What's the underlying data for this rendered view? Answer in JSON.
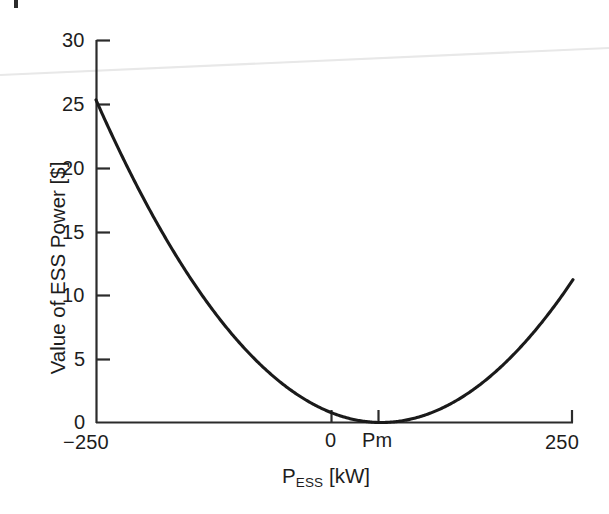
{
  "figure": {
    "background_color": "#ffffff",
    "line_color": "#1a1a1a",
    "axis_color": "#2b2b2b",
    "artifact": {
      "name": "scan-line-artifact",
      "color": "#e6e6e6",
      "description": "faint diagonal scan line"
    }
  },
  "chart_data": {
    "type": "line",
    "title": "",
    "xlabel": "P_ESS [kW]",
    "xlabel_base": "P",
    "xlabel_sub": "ESS",
    "xlabel_unit": " [kW]",
    "ylabel": "Value of ESS Power [$]",
    "xlim": [
      -250,
      250
    ],
    "ylim": [
      0,
      30
    ],
    "grid": false,
    "legend": null,
    "x_ticks": [
      -250,
      0,
      49,
      250
    ],
    "x_tick_labels": [
      "−250",
      "0",
      "Pm",
      "250"
    ],
    "y_ticks": [
      0,
      5,
      10,
      15,
      20,
      25,
      30
    ],
    "y_tick_labels": [
      "0",
      "5",
      "10",
      "15",
      "20",
      "25",
      "30"
    ],
    "annotations": [
      {
        "name": "minimum-marker",
        "label": "Pm",
        "x": 49,
        "y": 0
      }
    ],
    "series": [
      {
        "name": "value-of-ess-power",
        "x": [
          -250,
          -225,
          -200,
          -175,
          -150,
          -125,
          -100,
          -75,
          -50,
          -25,
          0,
          25,
          49,
          75,
          100,
          125,
          150,
          175,
          200,
          225,
          250
        ],
        "y": [
          25.3,
          22.9,
          20.6,
          18.4,
          16.3,
          14.3,
          12.4,
          10.6,
          8.9,
          7.3,
          5.8,
          4.4,
          0.1,
          1.2,
          2.3,
          3.4,
          4.6,
          5.9,
          7.3,
          9.1,
          11.2
        ]
      }
    ]
  }
}
